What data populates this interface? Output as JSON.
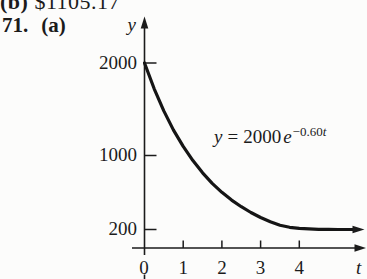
{
  "page": {
    "top_line": {
      "label": "(b)",
      "value": "$1105.17"
    },
    "problem_number": "71.",
    "part_label": "(a)"
  },
  "chart_data": {
    "type": "line",
    "function": "y = 2000e^(-0.60t)",
    "equation": {
      "var": "y",
      "equals": "=",
      "coefficient": "2000",
      "base": "e",
      "exponent_coeff": "−0.60",
      "exponent_var": "t"
    },
    "xlabel": "t",
    "ylabel": "y",
    "xlim": [
      0,
      5.8
    ],
    "ylim": [
      0,
      2200
    ],
    "grid": false,
    "x_ticks": [
      "0",
      "1",
      "2",
      "3",
      "4"
    ],
    "y_ticks": [
      "200",
      "1000",
      "2000"
    ],
    "y_intercept": 2000,
    "horizontal_asymptote_shown": 200,
    "curve_points": {
      "t": [
        0,
        0.25,
        0.5,
        0.75,
        1,
        1.25,
        1.5,
        1.75,
        2,
        2.25,
        2.5,
        2.75,
        3,
        3.25,
        3.5,
        3.75,
        4,
        4.25,
        4.5,
        4.75,
        5,
        5.25,
        5.5
      ],
      "y": [
        2000,
        1721,
        1482,
        1275,
        1098,
        945,
        813,
        700,
        602,
        518,
        446,
        384,
        330,
        284,
        245,
        224,
        212,
        206,
        202,
        201,
        200,
        200,
        200
      ]
    }
  }
}
